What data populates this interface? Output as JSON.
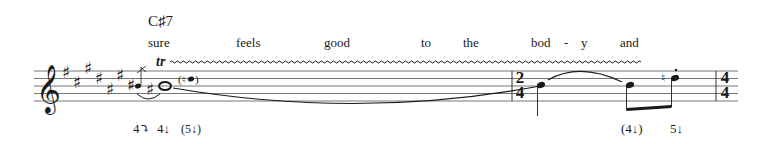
{
  "score": {
    "chord_symbol": "C♯7",
    "lyrics": [
      "sure",
      "feels",
      "good",
      "to",
      "the",
      "bod",
      "-",
      "y",
      "and"
    ],
    "ornament": {
      "label": "tr",
      "type": "trill"
    },
    "clef": "treble",
    "key_signature": {
      "accidental": "sharp",
      "count": 7
    },
    "time_signatures": [
      {
        "top": "2",
        "bottom": "4"
      },
      {
        "top": "4",
        "bottom": "4"
      }
    ],
    "fingerings": {
      "group1": [
        "4⤵",
        "4↓",
        "(5↓)"
      ],
      "group2": [
        "(4↓)",
        "5↓"
      ]
    },
    "colors": {
      "ink": "#1a1a1a",
      "staff": "#555555"
    }
  }
}
